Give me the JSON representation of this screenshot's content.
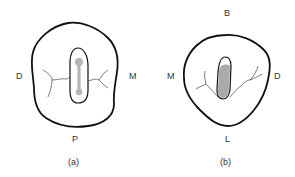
{
  "figure_a": {
    "caption": "(a)",
    "labels": {
      "left": "D",
      "right": "M",
      "bottom": "P"
    }
  },
  "figure_b": {
    "caption": "(b)",
    "labels": {
      "top": "B",
      "left": "M",
      "right": "D",
      "bottom": "L"
    }
  },
  "colors": {
    "outline": "#111111",
    "canal_fill": "#aaaaaa",
    "nerve_lines": "#444444",
    "label": "#333333",
    "background": "#ffffff"
  }
}
